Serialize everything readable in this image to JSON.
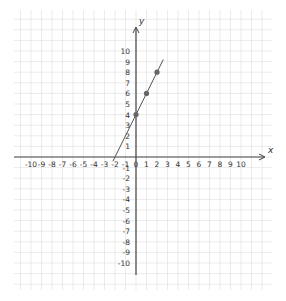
{
  "chart_data": {
    "type": "line",
    "title": "",
    "xlabel": "x",
    "ylabel": "y",
    "xlim": [
      -10,
      10
    ],
    "ylim": [
      -10,
      10
    ],
    "grid": true,
    "x_ticks": [
      -10,
      -9,
      -8,
      -7,
      -6,
      -5,
      -4,
      -3,
      -2,
      -1,
      0,
      1,
      2,
      3,
      4,
      5,
      6,
      7,
      8,
      9,
      10
    ],
    "y_ticks": [
      -10,
      -9,
      -8,
      -7,
      -6,
      -5,
      -4,
      -3,
      -2,
      -1,
      1,
      2,
      3,
      4,
      5,
      6,
      7,
      8,
      9,
      10
    ],
    "series": [
      {
        "name": "line",
        "equation": "y = 2x + 4",
        "points": [
          {
            "x": 0,
            "y": 4
          },
          {
            "x": 1,
            "y": 6
          },
          {
            "x": 2,
            "y": 8
          }
        ],
        "line_extent": {
          "x_start": -2.2,
          "x_end": 2.6
        }
      }
    ],
    "colors": {
      "axis": "#444444",
      "grid": "#e2e2e2",
      "line": "#555555",
      "point": "#666666"
    }
  },
  "labels": {
    "x_axis": "x",
    "y_axis": "y",
    "origin": "0"
  }
}
